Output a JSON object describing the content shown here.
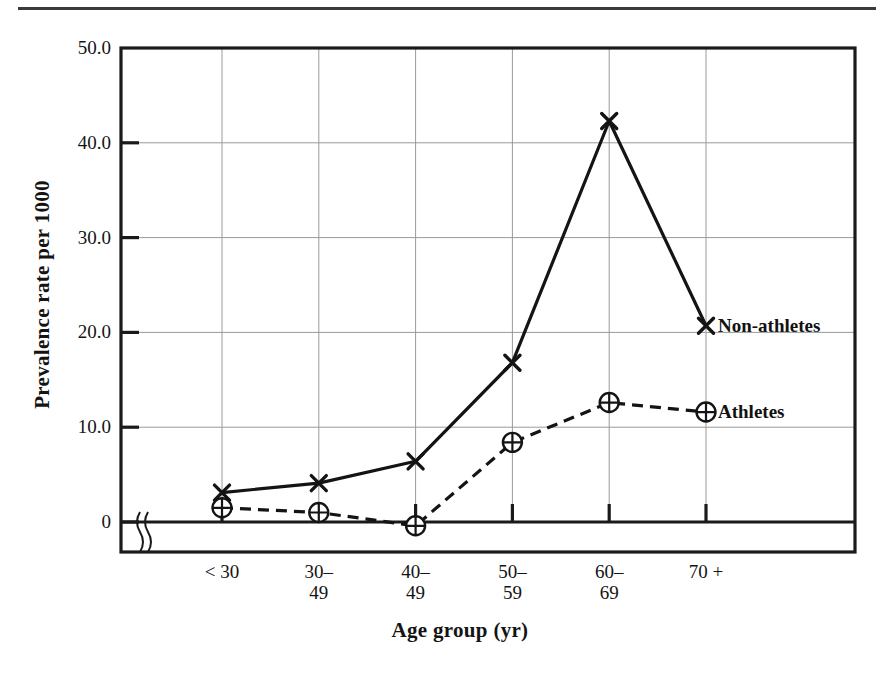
{
  "figure": {
    "kind": "line-chart",
    "page_rule": "horizontal-rule"
  },
  "chart_data": {
    "type": "line",
    "title": "",
    "xlabel": "Age group (yr)",
    "ylabel": "Prevalence rate per 1000",
    "categories": [
      "< 30",
      "30–49",
      "40–49",
      "50–59",
      "60–69",
      "70 +"
    ],
    "category_lines": [
      [
        "< 30"
      ],
      [
        "30–",
        "49"
      ],
      [
        "40–",
        "49"
      ],
      [
        "50–",
        "59"
      ],
      [
        "60–",
        "69"
      ],
      [
        "70 +"
      ]
    ],
    "ylim": [
      0,
      50
    ],
    "yticks": [
      0,
      10,
      20,
      30,
      40,
      50
    ],
    "ytick_labels": [
      "0",
      "10.0",
      "20.0",
      "30.0",
      "40.0",
      "50.0"
    ],
    "grid": true,
    "axis_break": true,
    "legend_position": "right-inline-at-last-point",
    "series": [
      {
        "name": "Non-athletes",
        "marker": "x-cross",
        "linestyle": "solid",
        "color": "#141414",
        "values": [
          3.1,
          4.1,
          6.4,
          16.8,
          42.3,
          20.7
        ]
      },
      {
        "name": "Athletes",
        "marker": "circle-plus",
        "linestyle": "dashed",
        "color": "#141414",
        "values": [
          1.5,
          1.0,
          -0.4,
          8.4,
          12.6,
          11.6
        ]
      }
    ]
  },
  "axis": {
    "y_title": "Prevalence rate per 1000",
    "x_title": "Age group (yr)"
  }
}
